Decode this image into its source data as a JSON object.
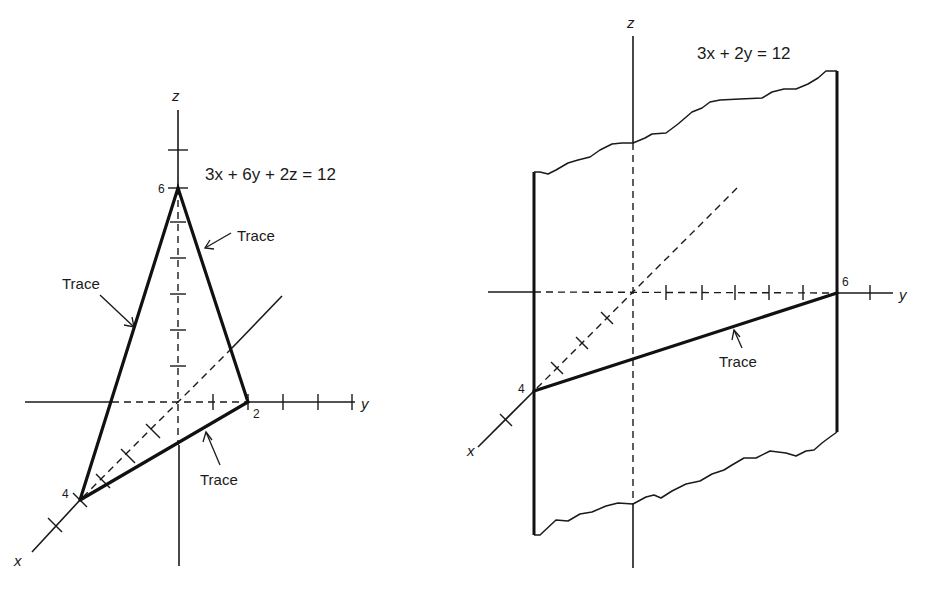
{
  "figures": [
    {
      "id": "left",
      "equation": "3x + 6y + 2z = 12",
      "axis_labels": {
        "x": "x",
        "y": "y",
        "z": "z"
      },
      "intercepts": {
        "x": "4",
        "y": "2",
        "z": "6"
      },
      "trace_labels": [
        "Trace",
        "Trace",
        "Trace"
      ]
    },
    {
      "id": "right",
      "equation": "3x + 2y = 12",
      "axis_labels": {
        "x": "x",
        "y": "y",
        "z": "z"
      },
      "intercepts": {
        "x": "4",
        "y": "6"
      },
      "trace_labels": [
        "Trace"
      ]
    }
  ],
  "colors": {
    "ink": "#1a1a1a",
    "background": "#ffffff"
  }
}
